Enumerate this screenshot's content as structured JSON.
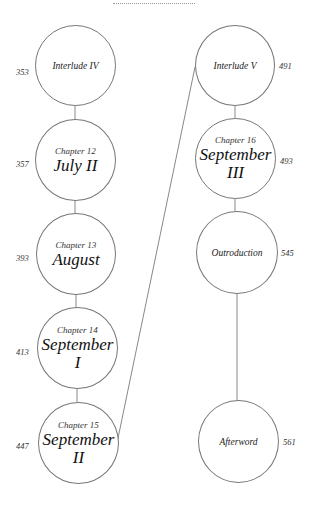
{
  "diagram": {
    "nodes": [
      {
        "id": "interlude-iv",
        "chapter": "",
        "title": "Interlude IV",
        "page": "353"
      },
      {
        "id": "ch12",
        "chapter": "Chapter 12",
        "title": "July II",
        "page": "357"
      },
      {
        "id": "ch13",
        "chapter": "Chapter 13",
        "title": "August",
        "page": "393"
      },
      {
        "id": "ch14",
        "chapter": "Chapter 14",
        "title": "September I",
        "title_line1": "September",
        "title_line2": "I",
        "page": "413"
      },
      {
        "id": "ch15",
        "chapter": "Chapter 15",
        "title": "September II",
        "title_line1": "September",
        "title_line2": "II",
        "page": "447"
      },
      {
        "id": "interlude-v",
        "chapter": "",
        "title": "Interlude V",
        "page": "491"
      },
      {
        "id": "ch16",
        "chapter": "Chapter 16",
        "title": "September III",
        "title_line1": "September",
        "title_line2": "III",
        "page": "493"
      },
      {
        "id": "outroduction",
        "chapter": "",
        "title": "Outroduction",
        "page": "545"
      },
      {
        "id": "afterword",
        "chapter": "",
        "title": "Afterword",
        "page": "561"
      }
    ],
    "edges": [
      [
        "interlude-iv",
        "ch12"
      ],
      [
        "ch12",
        "ch13"
      ],
      [
        "ch13",
        "ch14"
      ],
      [
        "ch14",
        "ch15"
      ],
      [
        "ch15",
        "interlude-v"
      ],
      [
        "interlude-v",
        "ch16"
      ],
      [
        "ch16",
        "outroduction"
      ],
      [
        "outroduction",
        "afterword"
      ]
    ],
    "colors": {
      "stroke": "#777777",
      "text": "#222222",
      "background": "#ffffff"
    }
  }
}
